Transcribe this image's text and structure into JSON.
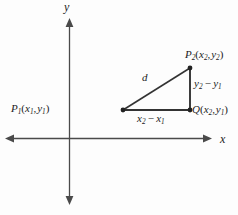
{
  "figure": {
    "background_color": "#fdfdfd",
    "stroke_color": "#4a4a4a",
    "triangle_color": "#333333",
    "text_color": "#1c1c1c",
    "axes": {
      "x_label": "x",
      "y_label": "y",
      "origin": {
        "x": 69,
        "y": 138
      },
      "x_axis": {
        "x1": 5,
        "y1": 138,
        "x2": 212,
        "y2": 138
      },
      "y_axis": {
        "x1": 69,
        "y1": 18,
        "x2": 69,
        "y2": 205
      }
    },
    "points": {
      "p1": {
        "name": "P",
        "subscript": "1",
        "coords": [
          "x",
          "1",
          "y",
          "1"
        ],
        "label_text": "P₁(x₁, y₁)",
        "x": 123,
        "y": 110
      },
      "p2": {
        "name": "P",
        "subscript": "2",
        "coords": [
          "x",
          "2",
          "y",
          "2"
        ],
        "label_text": "P₂(x₂, y₂)",
        "x": 190,
        "y": 68
      },
      "q": {
        "name": "Q",
        "subscript": "",
        "coords": [
          "x",
          "2",
          "y",
          "1"
        ],
        "label_text": "Q(x₂, y₁)",
        "x": 190,
        "y": 110
      }
    },
    "segments": {
      "hypotenuse_label": "d",
      "vertical_leg_label": "y₂ − y₁",
      "horizontal_leg_label": "x₂ − x₁"
    },
    "glyphs": {
      "minus": "−",
      "comma": ",",
      "open_paren": "(",
      "close_paren": ")",
      "var_x": "x",
      "var_y": "y",
      "var_d": "d",
      "name_p": "P",
      "name_q": "Q",
      "sub_1": "1",
      "sub_2": "2"
    }
  }
}
